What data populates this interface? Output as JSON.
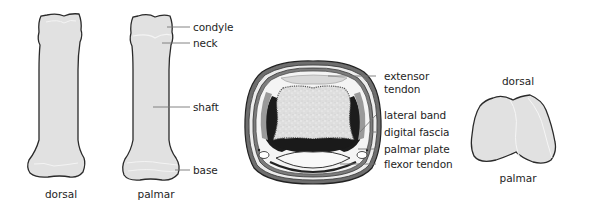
{
  "figure": {
    "panels": [
      {
        "id": "phalanx-dorsal",
        "caption": "dorsal"
      },
      {
        "id": "phalanx-palmar",
        "caption": "palmar",
        "labels": [
          "condyle",
          "neck",
          "shaft",
          "base"
        ]
      },
      {
        "id": "cross-section",
        "labels": [
          "extensor",
          "tendon",
          "lateral band",
          "digital fascia",
          "palmar plate",
          "flexor tendon"
        ]
      },
      {
        "id": "base-end-view",
        "top_label": "dorsal",
        "bottom_label": "palmar"
      }
    ],
    "colors": {
      "bone_fill": "#e2e2e2",
      "outline": "#2a2a2a",
      "leader_line": "#777777",
      "dark_tissue": "#1a1a1a",
      "mid_gray": "#8a8a8a"
    }
  }
}
